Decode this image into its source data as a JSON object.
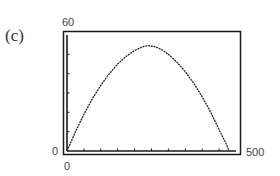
{
  "panel_label": "(c)",
  "chart_data": {
    "type": "line",
    "title": "",
    "xlabel": "",
    "ylabel": "",
    "xlim": [
      0,
      500
    ],
    "ylim": [
      0,
      60
    ],
    "x_tick_labels": [
      "0",
      "500"
    ],
    "y_tick_labels": [
      "0",
      "60"
    ],
    "x_tick_step": 50,
    "y_tick_step": 10,
    "grid": false,
    "legend": null,
    "series": [
      {
        "name": "curve",
        "x": [
          0,
          25,
          50,
          75,
          100,
          125,
          150,
          175,
          200,
          225,
          240,
          260,
          280,
          300,
          325,
          350,
          375,
          400,
          425,
          450,
          470,
          480
        ],
        "y": [
          0,
          10,
          19,
          27,
          34,
          40,
          45,
          49,
          52,
          54,
          54.5,
          54,
          52.5,
          50,
          46,
          41,
          35,
          28,
          20,
          11,
          4,
          0
        ]
      }
    ]
  },
  "labels": {
    "ymax": "60",
    "ymin": "0",
    "xmin": "0",
    "xmax": "500"
  },
  "colors": {
    "frame": "#1a1a1a",
    "curve": "#222222"
  }
}
